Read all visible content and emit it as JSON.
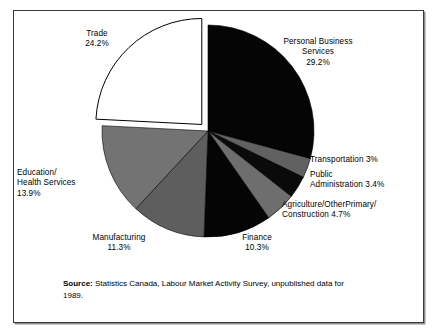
{
  "figure": {
    "frame_border_color": "#3a3a3a",
    "background": "#ffffff"
  },
  "source": {
    "label": "Source:",
    "text": " Statistics Canada, Labour Market Activity Survey, unpublished data for 1989."
  },
  "labels": {
    "trade": "Trade\n24.2%",
    "personal_business_services": "Personal Business\nServices\n29.2%",
    "transportation": "Transportation  3%",
    "public_administration": "Public\nAdministration  3.4%",
    "agriculture": "Agriculture/OtherPrimary/\nConstruction  4.7%",
    "finance": "Finance\n10.3%",
    "manufacturing": "Manufacturing\n11.3%",
    "education_health": "Education/\nHealth Services\n13.9%"
  },
  "chart_data": {
    "type": "pie",
    "title": "",
    "subtitle": "",
    "xlabel": "",
    "ylabel": "",
    "grid": false,
    "legend_position": "none",
    "units": "percent",
    "start_angle_deg": 0,
    "direction": "clockwise",
    "center": {
      "x": 208,
      "y": 131
    },
    "radius": 106,
    "categories": [
      "Personal Business Services",
      "Transportation",
      "Public Administration",
      "Agriculture/OtherPrimary/Construction",
      "Finance",
      "Manufacturing",
      "Education/Health Services",
      "Trade"
    ],
    "values": [
      29.2,
      3.0,
      3.4,
      4.7,
      10.3,
      11.3,
      13.9,
      24.2
    ],
    "value_labels": [
      "29.2%",
      "3%",
      "3.4%",
      "4.7%",
      "10.3%",
      "11.3%",
      "13.9%",
      "24.2%"
    ],
    "slice_colors": [
      "#050505",
      "#616161",
      "#0a0a0a",
      "#6e6e6e",
      "#050505",
      "#5e5e5e",
      "#737373",
      "#ffffff"
    ],
    "exploded": [
      false,
      false,
      false,
      false,
      false,
      false,
      false,
      true
    ],
    "explode_offset_px": 9,
    "slice_outline_color": "#000000"
  }
}
